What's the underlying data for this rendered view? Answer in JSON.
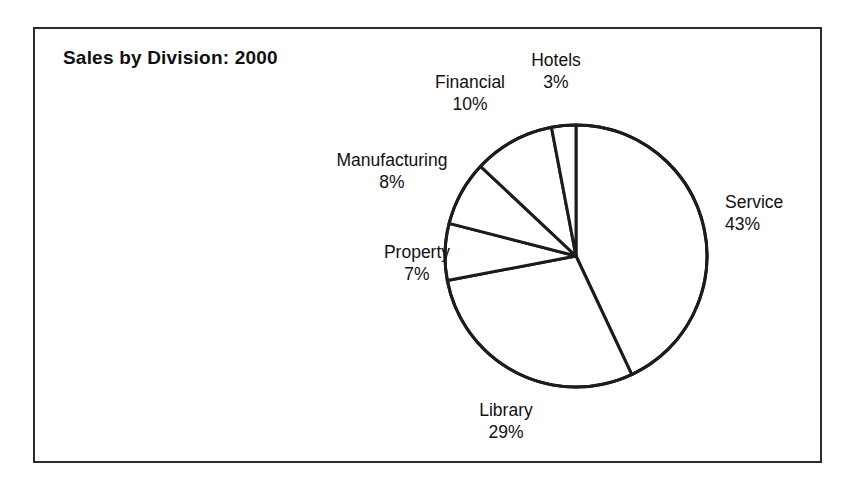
{
  "figure": {
    "title": "Sales by Division: 2000"
  },
  "chart_data": {
    "type": "pie",
    "title": "Sales by Division: 2000",
    "xlabel": "",
    "ylabel": "",
    "unit": "%",
    "total": 100,
    "start_angle_deg": 0,
    "direction": "clockwise",
    "legend": "none",
    "labels_placement": "outside-callout",
    "fill": "#ffffff",
    "stroke": "#1c1c1c",
    "categories": [
      "Service",
      "Library",
      "Property",
      "Manufacturing",
      "Financial",
      "Hotels"
    ],
    "values": [
      43,
      29,
      7,
      8,
      10,
      3
    ],
    "slices": [
      {
        "name": "Service",
        "value": 43,
        "label": "Service",
        "value_label": "43%"
      },
      {
        "name": "Library",
        "value": 29,
        "label": "Library",
        "value_label": "29%"
      },
      {
        "name": "Property",
        "value": 7,
        "label": "Property",
        "value_label": "7%"
      },
      {
        "name": "Manufacturing",
        "value": 8,
        "label": "Manufacturing",
        "value_label": "8%"
      },
      {
        "name": "Financial",
        "value": 10,
        "label": "Financial",
        "value_label": "10%"
      },
      {
        "name": "Hotels",
        "value": 3,
        "label": "Hotels",
        "value_label": "3%"
      }
    ]
  }
}
